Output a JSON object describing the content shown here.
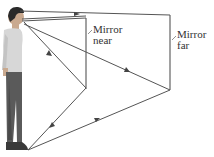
{
  "diagram": {
    "type": "ray-optics",
    "labels": {
      "mirror_near_line1": "Mirror",
      "mirror_near_line2": "near",
      "mirror_far_line1": "Mirror",
      "mirror_far_line2": "far"
    },
    "colors": {
      "ray": "#555555",
      "mirror": "#8a8a8a",
      "text": "#333333"
    },
    "mirrors": [
      {
        "name": "near",
        "x": 86,
        "y_top": 18,
        "y_bottom": 89
      },
      {
        "name": "far",
        "x": 170,
        "y_top": 15,
        "y_bottom": 90
      }
    ],
    "person": {
      "eye": [
        23,
        19
      ],
      "feet": [
        28,
        150
      ]
    }
  }
}
